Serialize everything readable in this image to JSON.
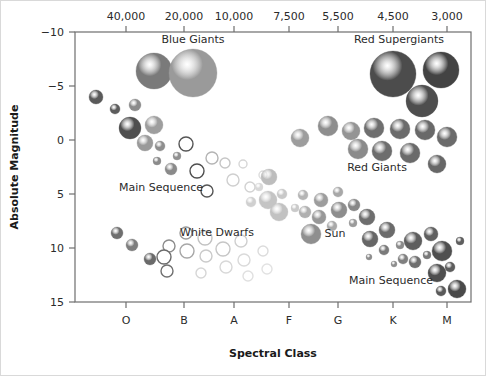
{
  "figure": {
    "background_color": "#ffffff",
    "border_color": "#d9d9d9",
    "plot_frame_color": "#6e6e6e"
  },
  "axes": {
    "y_title": "Absolute Magnitude",
    "x_title": "Spectral Class",
    "y_ticks": [
      "-10",
      "-5",
      "0",
      "5",
      "10",
      "15"
    ],
    "x_top_ticks": [
      "40,000",
      "20,000",
      "10,000",
      "7,500",
      "5,500",
      "4,500",
      "3,000"
    ],
    "x_bottom_ticks": [
      "O",
      "B",
      "A",
      "F",
      "G",
      "K",
      "M"
    ]
  },
  "annotations": [
    {
      "name": "blue-giants",
      "text": "Blue Giants",
      "x": 192,
      "y": 42
    },
    {
      "name": "red-supergiants",
      "text": "Red Supergiants",
      "x": 398,
      "y": 42
    },
    {
      "name": "main-sequence-upper",
      "text": "Main Sequence",
      "x": 160,
      "y": 190
    },
    {
      "name": "red-giants",
      "text": "Red Giants",
      "x": 376,
      "y": 170
    },
    {
      "name": "white-dwarfs",
      "text": "White Dwarfs",
      "x": 216,
      "y": 235
    },
    {
      "name": "sun",
      "text": "Sun",
      "x": 334,
      "y": 236
    },
    {
      "name": "main-sequence-lower",
      "text": "Main Sequence",
      "x": 390,
      "y": 283
    }
  ],
  "chart_data": {
    "type": "scatter",
    "xlabel": "Spectral Class",
    "ylabel": "Absolute Magnitude",
    "x_axis_secondary_label": "Surface Temperature (K)",
    "ylim": [
      -10,
      15
    ],
    "y_inverted": true,
    "grid": false,
    "legend": "none",
    "x_categories": [
      "O",
      "B",
      "A",
      "F",
      "G",
      "K",
      "M"
    ],
    "x_temperatures": [
      40000,
      20000,
      10000,
      7500,
      5500,
      4500,
      3000
    ],
    "note": "Marker radius encodes stellar size; fill shade encodes color/temperature. px coordinates are within the 486x376 canvas.",
    "groups": [
      {
        "name": "Blue Giants",
        "fill": "#8c8c8c",
        "points": [
          {
            "px": 153,
            "py": 70,
            "r": 18,
            "fill": "#7a7a7a"
          },
          {
            "px": 192,
            "py": 72,
            "r": 24,
            "fill": "#9a9a9a"
          }
        ]
      },
      {
        "name": "Red Supergiants",
        "fill": "#4a4a4a",
        "points": [
          {
            "px": 392,
            "py": 73,
            "r": 23,
            "fill": "#4c4c4c"
          },
          {
            "px": 440,
            "py": 69,
            "r": 18,
            "fill": "#434343"
          },
          {
            "px": 421,
            "py": 100,
            "r": 16,
            "fill": "#4e4e4e"
          }
        ]
      },
      {
        "name": "Red Giants",
        "fill": "#7b7b7b",
        "points": [
          {
            "px": 299,
            "py": 137,
            "r": 9,
            "fill": "#9d9d9d"
          },
          {
            "px": 327,
            "py": 125,
            "r": 10,
            "fill": "#8e8e8e"
          },
          {
            "px": 350,
            "py": 130,
            "r": 9,
            "fill": "#949494"
          },
          {
            "px": 373,
            "py": 127,
            "r": 10,
            "fill": "#6f6f6f"
          },
          {
            "px": 399,
            "py": 128,
            "r": 10,
            "fill": "#6b6b6b"
          },
          {
            "px": 424,
            "py": 129,
            "r": 10,
            "fill": "#696969"
          },
          {
            "px": 357,
            "py": 148,
            "r": 10,
            "fill": "#8b8b8b"
          },
          {
            "px": 381,
            "py": 150,
            "r": 10,
            "fill": "#6d6d6d"
          },
          {
            "px": 409,
            "py": 152,
            "r": 10,
            "fill": "#6a6a6a"
          },
          {
            "px": 436,
            "py": 163,
            "r": 9,
            "fill": "#676767"
          },
          {
            "px": 446,
            "py": 136,
            "r": 10,
            "fill": "#6b6b6b"
          }
        ]
      },
      {
        "name": "Main Sequence Upper",
        "fill": "#6a6a6a",
        "points": [
          {
            "px": 95,
            "py": 96,
            "r": 7,
            "fill": "#5a5a5a"
          },
          {
            "px": 114,
            "py": 108,
            "r": 5,
            "fill": "#5d5d5d"
          },
          {
            "px": 134,
            "py": 104,
            "r": 6,
            "fill": "#8b8b8b"
          },
          {
            "px": 129,
            "py": 127,
            "r": 11,
            "fill": "#4f4f4f"
          },
          {
            "px": 153,
            "py": 124,
            "r": 9,
            "fill": "#9e9e9e"
          },
          {
            "px": 144,
            "py": 142,
            "r": 8,
            "fill": "#9a9a9a"
          },
          {
            "px": 159,
            "py": 145,
            "r": 5,
            "fill": "#8e8e8e"
          },
          {
            "px": 176,
            "py": 155,
            "r": 4,
            "fill": "#909090"
          },
          {
            "px": 156,
            "py": 160,
            "r": 4,
            "fill": "#8b8b8b"
          },
          {
            "px": 170,
            "py": 168,
            "r": 6,
            "fill": "#8a8a8a"
          }
        ]
      },
      {
        "name": "Main Sequence Open Circles",
        "fill": "none",
        "stroke": "#8a8a8a",
        "points": [
          {
            "px": 185,
            "py": 143,
            "r": 7,
            "stroke": "#555555"
          },
          {
            "px": 211,
            "py": 157,
            "r": 6,
            "stroke": "#b4b4b4"
          },
          {
            "px": 196,
            "py": 170,
            "r": 7,
            "stroke": "#4f4f4f"
          },
          {
            "px": 224,
            "py": 162,
            "r": 5,
            "stroke": "#c6c6c6"
          },
          {
            "px": 206,
            "py": 190,
            "r": 6,
            "stroke": "#555555"
          },
          {
            "px": 232,
            "py": 179,
            "r": 6,
            "stroke": "#cfcfcf"
          },
          {
            "px": 242,
            "py": 163,
            "r": 4,
            "stroke": "#d6d6d6"
          },
          {
            "px": 249,
            "py": 186,
            "r": 5,
            "stroke": "#d2d2d2"
          },
          {
            "px": 262,
            "py": 174,
            "r": 4,
            "stroke": "#dcdcdc"
          }
        ]
      },
      {
        "name": "Main Sequence Middle",
        "fill": "#a6a6a6",
        "points": [
          {
            "px": 250,
            "py": 201,
            "r": 5,
            "fill": "#d0d0d0"
          },
          {
            "px": 258,
            "py": 186,
            "r": 4,
            "fill": "#d8d8d8"
          },
          {
            "px": 267,
            "py": 199,
            "r": 9,
            "fill": "#c4c4c4"
          },
          {
            "px": 268,
            "py": 176,
            "r": 8,
            "fill": "#bdbdbd"
          },
          {
            "px": 281,
            "py": 193,
            "r": 5,
            "fill": "#c8c8c8"
          },
          {
            "px": 278,
            "py": 211,
            "r": 9,
            "fill": "#c2c2c2"
          },
          {
            "px": 294,
            "py": 207,
            "r": 4,
            "fill": "#cacaca"
          },
          {
            "px": 302,
            "py": 194,
            "r": 5,
            "fill": "#b5b5b5"
          },
          {
            "px": 304,
            "py": 211,
            "r": 6,
            "fill": "#b0b0b0"
          },
          {
            "px": 320,
            "py": 199,
            "r": 7,
            "fill": "#9d9d9d"
          },
          {
            "px": 318,
            "py": 216,
            "r": 7,
            "fill": "#989898"
          },
          {
            "px": 337,
            "py": 191,
            "r": 5,
            "fill": "#a8a8a8"
          },
          {
            "px": 338,
            "py": 209,
            "r": 8,
            "fill": "#8d8d8d"
          },
          {
            "px": 353,
            "py": 204,
            "r": 6,
            "fill": "#878787"
          },
          {
            "px": 352,
            "py": 222,
            "r": 4,
            "fill": "#9b9b9b"
          },
          {
            "px": 310,
            "py": 233,
            "r": 10,
            "fill": "#8f8f8f"
          },
          {
            "px": 331,
            "py": 225,
            "r": 5,
            "fill": "#a9a9a9"
          }
        ]
      },
      {
        "name": "Main Sequence Lower",
        "fill": "#5e5e5e",
        "points": [
          {
            "px": 366,
            "py": 216,
            "r": 8,
            "fill": "#6e6e6e"
          },
          {
            "px": 369,
            "py": 238,
            "r": 8,
            "fill": "#676767"
          },
          {
            "px": 386,
            "py": 229,
            "r": 8,
            "fill": "#6b6b6b"
          },
          {
            "px": 383,
            "py": 249,
            "r": 5,
            "fill": "#7a7a7a"
          },
          {
            "px": 399,
            "py": 244,
            "r": 4,
            "fill": "#8b8b8b"
          },
          {
            "px": 402,
            "py": 258,
            "r": 5,
            "fill": "#808080"
          },
          {
            "px": 393,
            "py": 263,
            "r": 3,
            "fill": "#8e8e8e"
          },
          {
            "px": 412,
            "py": 240,
            "r": 9,
            "fill": "#5e5e5e"
          },
          {
            "px": 414,
            "py": 261,
            "r": 6,
            "fill": "#6f6f6f"
          },
          {
            "px": 426,
            "py": 254,
            "r": 4,
            "fill": "#797979"
          },
          {
            "px": 430,
            "py": 233,
            "r": 7,
            "fill": "#606060"
          },
          {
            "px": 436,
            "py": 272,
            "r": 9,
            "fill": "#4e4e4e"
          },
          {
            "px": 441,
            "py": 250,
            "r": 10,
            "fill": "#4f4f4f"
          },
          {
            "px": 449,
            "py": 266,
            "r": 5,
            "fill": "#5d5d5d"
          },
          {
            "px": 456,
            "py": 288,
            "r": 9,
            "fill": "#4a4a4a"
          },
          {
            "px": 440,
            "py": 290,
            "r": 5,
            "fill": "#5a5a5a"
          },
          {
            "px": 459,
            "py": 240,
            "r": 4,
            "fill": "#5f5f5f"
          },
          {
            "px": 368,
            "py": 256,
            "r": 3,
            "fill": "#8d8d8d"
          }
        ]
      },
      {
        "name": "Subdwarf Branch",
        "fill": "#6f6f6f",
        "points": [
          {
            "px": 116,
            "py": 232,
            "r": 6,
            "fill": "#6f6f6f"
          },
          {
            "px": 131,
            "py": 244,
            "r": 6,
            "fill": "#7e7e7e"
          },
          {
            "px": 149,
            "py": 258,
            "r": 6,
            "fill": "#6a6a6a"
          }
        ]
      },
      {
        "name": "White Dwarfs",
        "fill": "none",
        "stroke": "#9e9e9e",
        "points": [
          {
            "px": 168,
            "py": 245,
            "r": 6,
            "stroke": "#8c8c8c"
          },
          {
            "px": 185,
            "py": 232,
            "r": 6,
            "stroke": "#9a9a9a"
          },
          {
            "px": 163,
            "py": 256,
            "r": 7,
            "stroke": "#6b6b6b"
          },
          {
            "px": 186,
            "py": 250,
            "r": 7,
            "stroke": "#a7a7a7"
          },
          {
            "px": 166,
            "py": 270,
            "r": 6,
            "stroke": "#707070"
          },
          {
            "px": 204,
            "py": 237,
            "r": 7,
            "stroke": "#c2c2c2"
          },
          {
            "px": 205,
            "py": 255,
            "r": 6,
            "stroke": "#cacaca"
          },
          {
            "px": 200,
            "py": 272,
            "r": 5,
            "stroke": "#d6d6d6"
          },
          {
            "px": 222,
            "py": 248,
            "r": 7,
            "stroke": "#c6c6c6"
          },
          {
            "px": 225,
            "py": 266,
            "r": 6,
            "stroke": "#d8d8d8"
          },
          {
            "px": 240,
            "py": 240,
            "r": 6,
            "stroke": "#cfcfcf"
          },
          {
            "px": 243,
            "py": 259,
            "r": 6,
            "stroke": "#dadada"
          },
          {
            "px": 247,
            "py": 275,
            "r": 5,
            "stroke": "#e0e0e0"
          },
          {
            "px": 262,
            "py": 250,
            "r": 5,
            "stroke": "#dcdcdc"
          },
          {
            "px": 266,
            "py": 268,
            "r": 5,
            "stroke": "#e2e2e2"
          }
        ]
      }
    ]
  },
  "geometry": {
    "plot_left": 74,
    "plot_right": 470,
    "plot_top": 31,
    "plot_bottom": 301,
    "x_tick_px": [
      125,
      183,
      233,
      288,
      337,
      392,
      446
    ],
    "y_tick_px": [
      31,
      85,
      139,
      193,
      247,
      301
    ]
  }
}
